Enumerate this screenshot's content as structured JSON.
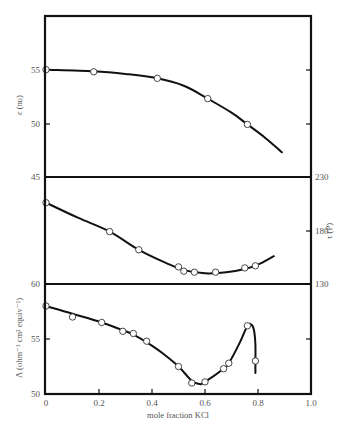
{
  "chart_data": [
    {
      "type": "line",
      "panel": "top",
      "title": "",
      "xlabel": "mole fraction KCl",
      "ylabel": "ε (nu)",
      "xlim": [
        0,
        1.0
      ],
      "ylim": [
        45,
        60
      ],
      "yticks": [
        45,
        50,
        55
      ],
      "grid": false,
      "series": [
        {
          "name": "ε",
          "points": [
            [
              0.0,
              55.0
            ],
            [
              0.18,
              54.8
            ],
            [
              0.42,
              54.2
            ],
            [
              0.61,
              52.3
            ],
            [
              0.76,
              49.9
            ]
          ],
          "curve": [
            [
              0.0,
              55.0
            ],
            [
              0.18,
              54.85
            ],
            [
              0.3,
              54.6
            ],
            [
              0.42,
              54.2
            ],
            [
              0.52,
              53.5
            ],
            [
              0.61,
              52.3
            ],
            [
              0.7,
              51.0
            ],
            [
              0.76,
              49.9
            ],
            [
              0.83,
              48.6
            ],
            [
              0.89,
              47.3
            ]
          ]
        }
      ]
    },
    {
      "type": "line",
      "panel": "middle",
      "xlabel": "mole fraction KCl",
      "ylabel": "τ (P)",
      "yaxis_side": "right",
      "xlim": [
        0,
        1.0
      ],
      "ylim": [
        130,
        230
      ],
      "yticks": [
        130,
        180,
        230
      ],
      "grid": false,
      "series": [
        {
          "name": "τ",
          "points": [
            [
              0.0,
              206
            ],
            [
              0.24,
              179
            ],
            [
              0.35,
              162
            ],
            [
              0.5,
              146
            ],
            [
              0.52,
              142
            ],
            [
              0.56,
              141
            ],
            [
              0.64,
              141
            ],
            [
              0.75,
              145
            ],
            [
              0.79,
              147
            ]
          ],
          "curve": [
            [
              0.0,
              206
            ],
            [
              0.12,
              192
            ],
            [
              0.24,
              179
            ],
            [
              0.35,
              162
            ],
            [
              0.45,
              150
            ],
            [
              0.52,
              143
            ],
            [
              0.6,
              140
            ],
            [
              0.68,
              141
            ],
            [
              0.75,
              144
            ],
            [
              0.8,
              148
            ],
            [
              0.86,
              156
            ]
          ]
        }
      ]
    },
    {
      "type": "line",
      "panel": "bottom",
      "xlabel": "mole fraction KCl",
      "ylabel": "Λ (ohm⁻¹ cm² equiv⁻¹)",
      "xlim": [
        0,
        1.0
      ],
      "ylim": [
        50,
        60
      ],
      "xticks": [
        0,
        0.2,
        0.4,
        0.6,
        0.8,
        1.0
      ],
      "yticks": [
        50,
        55,
        60
      ],
      "grid": false,
      "series": [
        {
          "name": "Λ",
          "points": [
            [
              0.0,
              58.0
            ],
            [
              0.1,
              57.0
            ],
            [
              0.21,
              56.5
            ],
            [
              0.29,
              55.7
            ],
            [
              0.33,
              55.5
            ],
            [
              0.38,
              54.8
            ],
            [
              0.5,
              52.5
            ],
            [
              0.55,
              51.0
            ],
            [
              0.6,
              51.1
            ],
            [
              0.67,
              52.3
            ],
            [
              0.69,
              52.8
            ],
            [
              0.76,
              56.2
            ],
            [
              0.79,
              53.0
            ]
          ],
          "curve": [
            [
              0.0,
              58.0
            ],
            [
              0.1,
              57.3
            ],
            [
              0.21,
              56.5
            ],
            [
              0.29,
              55.8
            ],
            [
              0.33,
              55.4
            ],
            [
              0.38,
              54.7
            ],
            [
              0.44,
              53.7
            ],
            [
              0.5,
              52.5
            ],
            [
              0.55,
              51.2
            ],
            [
              0.58,
              50.9
            ],
            [
              0.6,
              51.1
            ],
            [
              0.67,
              52.3
            ],
            [
              0.69,
              52.8
            ],
            [
              0.73,
              54.6
            ],
            [
              0.76,
              56.2
            ],
            [
              0.775,
              56.3
            ],
            [
              0.785,
              55.8
            ],
            [
              0.79,
              54.5
            ],
            [
              0.79,
              52.8
            ],
            [
              0.79,
              51.9
            ]
          ]
        }
      ]
    }
  ],
  "labels": {
    "top_ylabel": "ε (nu)",
    "middle_ylabel": "τ (P)",
    "bottom_ylabel": "Λ (ohm⁻¹ cm² equiv⁻¹)",
    "xlabel": "mole fraction KCl",
    "x_ticks": [
      "0",
      "0.2",
      "0.4",
      "0.6",
      "0.8",
      "1.0"
    ],
    "top_left_ticks": [
      "55",
      "50",
      "45"
    ],
    "middle_right_ticks": [
      "230",
      "180",
      "130"
    ],
    "bottom_left_ticks": [
      "60",
      "55",
      "50"
    ]
  }
}
